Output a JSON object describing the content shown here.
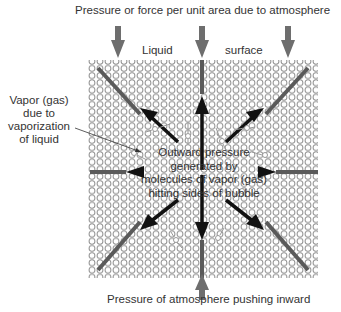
{
  "title": "Pressure or force per unit area due to atmosphere",
  "surface_label_left": "Liquid",
  "surface_label_right": "surface",
  "vapor_label": [
    "Vapor (gas)",
    "due to",
    "vaporization",
    "of liquid"
  ],
  "center_label": [
    "Outward pressure",
    "generated by",
    "molecules of vapor (gas)",
    "hitting sides of bubble"
  ],
  "bottom_label": "Pressure of atmosphere pushing inward",
  "colors": {
    "liquid_molecule": "#8a8a8a",
    "outward_arrow": "#111111",
    "inward_arrow": "#6e6e6e",
    "text": "#333333"
  }
}
